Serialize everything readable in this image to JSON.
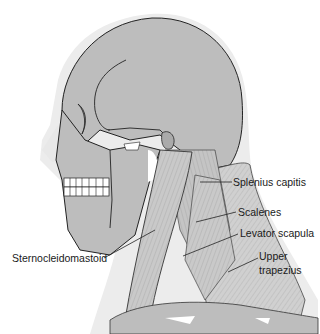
{
  "figure": {
    "colors": {
      "background": "#ffffff",
      "skin_halo": "#eeeeee",
      "bone": "#bdbdbd",
      "muscle": "#c9c9c9",
      "muscle_dark": "#a8a8a8",
      "outline": "#222222",
      "teeth": "#ffffff",
      "label_text": "#1a1a1a"
    },
    "labels": [
      {
        "id": "splenius-capitis",
        "text": "Splenius capitis"
      },
      {
        "id": "scalenes",
        "text": "Scalenes"
      },
      {
        "id": "levator-scapula",
        "text": "Levator scapula"
      },
      {
        "id": "upper-trapezius-line1",
        "text": "Upper"
      },
      {
        "id": "upper-trapezius-line2",
        "text": "trapezius"
      },
      {
        "id": "sternocleidomastoid",
        "text": "Sternocleidomastoid"
      }
    ]
  }
}
